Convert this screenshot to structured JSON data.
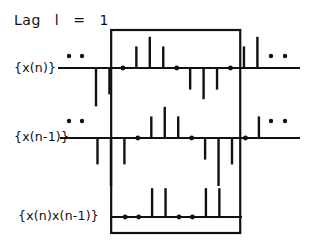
{
  "title": {
    "lag_label": "Lag",
    "lag_symbol": "l",
    "equals": "=",
    "lag_value": "1"
  },
  "rows": [
    {
      "label": "{x(n)}",
      "leading_ellipsis": true,
      "trailing_ellipsis": true,
      "samples": [
        -0.8,
        -0.55,
        0,
        0.45,
        0.65,
        0.45,
        0,
        -0.45,
        -0.65,
        -0.45,
        0,
        0.45,
        0.65
      ],
      "start_index": 0
    },
    {
      "label": "{x(n-1)}",
      "leading_ellipsis": true,
      "trailing_ellipsis": true,
      "samples": [
        -0.55,
        -1.0,
        -0.55,
        0,
        0.45,
        0.65,
        0.45,
        0,
        -0.45,
        -1.0,
        -0.55,
        0,
        0.45
      ],
      "start_index": 0
    },
    {
      "label": "{x(n)x(n-1)}",
      "leading_ellipsis": false,
      "trailing_ellipsis": false,
      "samples": [
        0,
        0,
        0.6,
        0.6,
        0,
        0,
        0.6,
        0.6
      ],
      "start_index": 2
    }
  ],
  "window": {
    "first_sample": 2,
    "last_sample": 10
  }
}
